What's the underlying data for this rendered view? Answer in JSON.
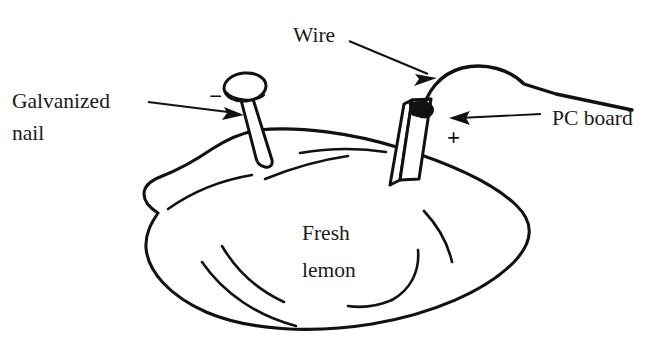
{
  "figure": {
    "background_color": "#ffffff",
    "ink_color": "#111111",
    "width": 664,
    "height": 349
  },
  "labels": {
    "galvanized_nail_line1": "Galvanized",
    "galvanized_nail_line2": "nail",
    "wire": "Wire",
    "pc_board": "PC board",
    "fresh_line1": "Fresh",
    "fresh_line2": "lemon",
    "negative_sign": "−",
    "positive_sign": "+"
  },
  "parts": {
    "nail": "galvanized-nail",
    "board": "pc-board",
    "lemon": "fresh-lemon",
    "wire": "connecting-wire",
    "solder": "solder-blob"
  },
  "annotations": [
    {
      "name": "galvanized-nail",
      "text": "Galvanized nail",
      "polarity": "−"
    },
    {
      "name": "wire",
      "text": "Wire",
      "polarity": ""
    },
    {
      "name": "pc-board",
      "text": "PC board",
      "polarity": "+"
    },
    {
      "name": "fresh-lemon",
      "text": "Fresh lemon",
      "polarity": ""
    }
  ]
}
